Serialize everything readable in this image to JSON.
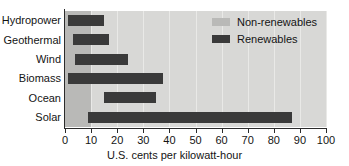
{
  "chart_data": {
    "type": "bar",
    "orientation": "horizontal",
    "bar_style": "range",
    "title": "",
    "subtitle": "",
    "xlabel": "U.S. cents per kilowatt-hour",
    "ylabel": "",
    "xlim": [
      0,
      100
    ],
    "xticks": [
      0,
      10,
      20,
      30,
      40,
      50,
      60,
      70,
      80,
      90,
      100
    ],
    "xtick_labels": [
      "0",
      "10",
      "20",
      "30",
      "40",
      "50",
      "60",
      "70",
      "80",
      "90",
      "100"
    ],
    "grid": true,
    "grid_axis": "x",
    "legend_position": "top-right",
    "categories": [
      "Hydropower",
      "Geothermal",
      "Wind",
      "Biomass",
      "Ocean",
      "Solar"
    ],
    "series": [
      {
        "name": "Renewables",
        "color": "#3a3a3a",
        "type": "range",
        "ranges": [
          {
            "category": "Hydropower",
            "start": 1,
            "end": 15
          },
          {
            "category": "Geothermal",
            "start": 3,
            "end": 17
          },
          {
            "category": "Wind",
            "start": 4,
            "end": 24
          },
          {
            "category": "Biomass",
            "start": 1,
            "end": 37.5
          },
          {
            "category": "Ocean",
            "start": 15,
            "end": 35
          },
          {
            "category": "Solar",
            "start": 9,
            "end": 87
          }
        ]
      },
      {
        "name": "Non-renewables",
        "color": "#b9b9b7",
        "type": "band",
        "ranges": [
          {
            "category": "all",
            "start": 0,
            "end": 10
          }
        ]
      }
    ],
    "annotations": []
  },
  "legend": {
    "items": [
      {
        "label": "Non-renewables",
        "color": "#b9b9b7",
        "swatch_name": "legend-swatch-non-renewables"
      },
      {
        "label": "Renewables",
        "color": "#3a3a3a",
        "swatch_name": "legend-swatch-renewables"
      }
    ]
  },
  "axis": {
    "x_label": "U.S. cents per kilowatt-hour",
    "tick_labels": [
      "0",
      "10",
      "20",
      "30",
      "40",
      "50",
      "60",
      "70",
      "80",
      "90",
      "100"
    ]
  },
  "categories": [
    "Hydropower",
    "Geothermal",
    "Wind",
    "Biomass",
    "Ocean",
    "Solar"
  ],
  "colors": {
    "plot_background": "#d8d8d6",
    "gridline": "#e9e9e7",
    "band": "#b9b9b7",
    "bar": "#3a3a3a",
    "axis": "#2b2b2b",
    "text": "#141414",
    "page_background": "#ffffff"
  }
}
